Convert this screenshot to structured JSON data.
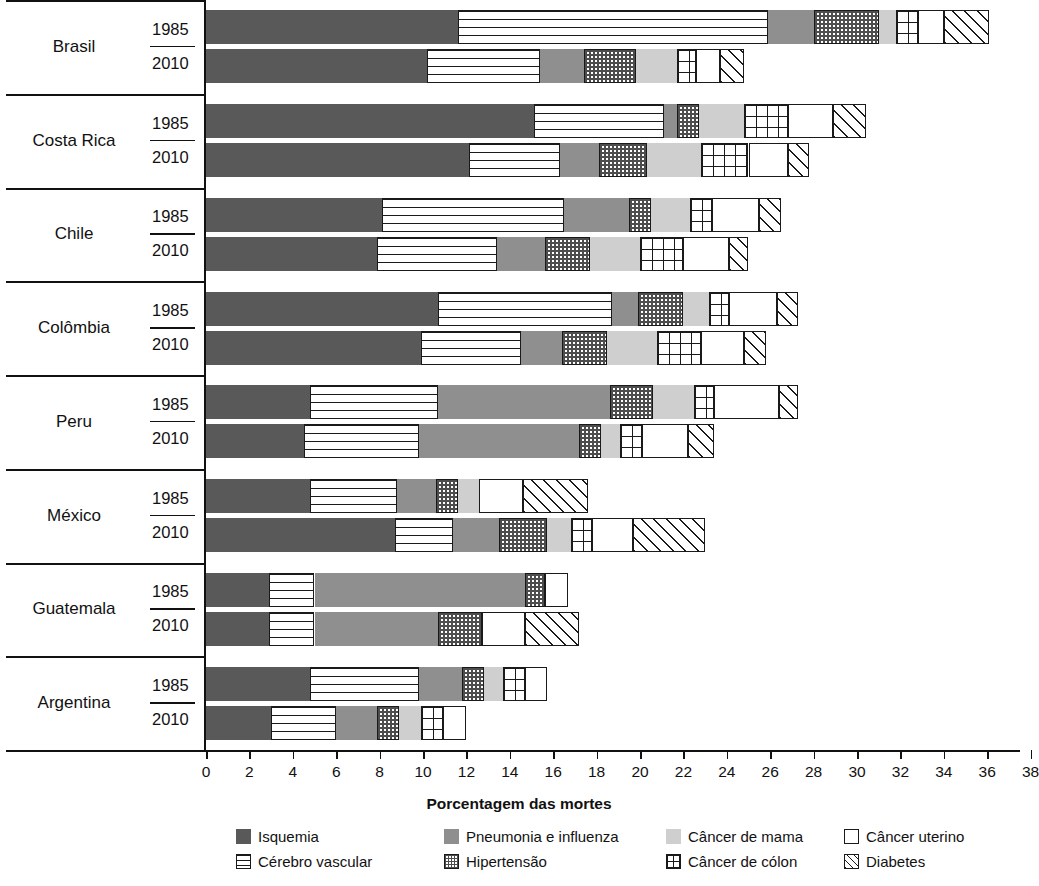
{
  "chart_data": {
    "type": "bar",
    "orientation": "horizontal",
    "stacked": true,
    "title": "",
    "xlabel": "Porcentagem das mortes",
    "ylabel": "",
    "xlim": [
      0,
      38
    ],
    "xticks": [
      0,
      2,
      4,
      6,
      8,
      10,
      12,
      14,
      16,
      18,
      20,
      22,
      24,
      26,
      28,
      30,
      32,
      34,
      36,
      38
    ],
    "grid": false,
    "legend_position": "bottom",
    "series": [
      {
        "name": "Isquemia",
        "key": "isquemia",
        "fill": "solid-dark-gray",
        "color": "#595959"
      },
      {
        "name": "Cérebro vascular",
        "key": "cerebro",
        "fill": "horizontal-lines",
        "color": "#ffffff"
      },
      {
        "name": "Pneumonia e influenza",
        "key": "pneumonia",
        "fill": "solid-mid-gray",
        "color": "#8f8f8f"
      },
      {
        "name": "Hipertensão",
        "key": "hipertensao",
        "fill": "checkerboard",
        "color": "#ffffff"
      },
      {
        "name": "Câncer de mama",
        "key": "mama",
        "fill": "solid-light-gray",
        "color": "#cfcfcf"
      },
      {
        "name": "Câncer de cólon",
        "key": "colon",
        "fill": "grid",
        "color": "#ffffff"
      },
      {
        "name": "Câncer uterino",
        "key": "uterino",
        "fill": "white",
        "color": "#ffffff"
      },
      {
        "name": "Diabetes",
        "key": "diabetes",
        "fill": "diagonal-hatch",
        "color": "#ffffff"
      }
    ],
    "groups": [
      {
        "country": "Brasil",
        "rows": [
          {
            "year": "1985",
            "values": {
              "isquemia": 11.6,
              "cerebro": 14.3,
              "pneumonia": 2.1,
              "hipertensao": 3.0,
              "mama": 0.8,
              "colon": 1.0,
              "uterino": 1.2,
              "diabetes": 2.1
            }
          },
          {
            "year": "2010",
            "values": {
              "isquemia": 10.2,
              "cerebro": 5.2,
              "pneumonia": 2.0,
              "hipertensao": 2.4,
              "mama": 1.9,
              "colon": 0.9,
              "uterino": 1.1,
              "diabetes": 1.1
            }
          }
        ]
      },
      {
        "country": "Costa Rica",
        "rows": [
          {
            "year": "1985",
            "values": {
              "isquemia": 15.1,
              "cerebro": 6.0,
              "pneumonia": 0.6,
              "hipertensao": 1.0,
              "mama": 2.1,
              "colon": 2.0,
              "uterino": 2.1,
              "diabetes": 1.5
            }
          },
          {
            "year": "2010",
            "values": {
              "isquemia": 12.1,
              "cerebro": 4.2,
              "pneumonia": 1.8,
              "hipertensao": 2.2,
              "mama": 2.5,
              "colon": 2.2,
              "uterino": 1.8,
              "diabetes": 1.0
            }
          }
        ]
      },
      {
        "country": "Chile",
        "rows": [
          {
            "year": "1985",
            "values": {
              "isquemia": 8.1,
              "cerebro": 8.4,
              "pneumonia": 3.0,
              "hipertensao": 1.0,
              "mama": 1.8,
              "colon": 1.0,
              "uterino": 2.2,
              "diabetes": 1.0
            }
          },
          {
            "year": "2010",
            "values": {
              "isquemia": 7.9,
              "cerebro": 5.5,
              "pneumonia": 2.2,
              "hipertensao": 2.1,
              "mama": 2.3,
              "colon": 2.0,
              "uterino": 2.1,
              "diabetes": 0.9
            }
          }
        ]
      },
      {
        "country": "Colômbia",
        "rows": [
          {
            "year": "1985",
            "values": {
              "isquemia": 10.7,
              "cerebro": 8.0,
              "pneumonia": 1.2,
              "hipertensao": 2.1,
              "mama": 1.2,
              "colon": 0.9,
              "uterino": 2.2,
              "diabetes": 1.0
            }
          },
          {
            "year": "2010",
            "values": {
              "isquemia": 9.9,
              "cerebro": 4.6,
              "pneumonia": 1.9,
              "hipertensao": 2.1,
              "mama": 2.3,
              "colon": 2.0,
              "uterino": 2.0,
              "diabetes": 1.0
            }
          }
        ]
      },
      {
        "country": "Peru",
        "rows": [
          {
            "year": "1985",
            "values": {
              "isquemia": 4.8,
              "cerebro": 5.9,
              "pneumonia": 7.9,
              "hipertensao": 2.0,
              "mama": 1.9,
              "colon": 0.9,
              "uterino": 3.0,
              "diabetes": 0.9
            }
          },
          {
            "year": "2010",
            "values": {
              "isquemia": 4.5,
              "cerebro": 5.3,
              "pneumonia": 7.4,
              "hipertensao": 1.0,
              "mama": 0.9,
              "colon": 1.0,
              "uterino": 2.1,
              "diabetes": 1.2
            }
          }
        ]
      },
      {
        "country": "México",
        "rows": [
          {
            "year": "1985",
            "values": {
              "isquemia": 4.8,
              "cerebro": 4.0,
              "pneumonia": 1.8,
              "hipertensao": 1.0,
              "mama": 1.0,
              "colon": 0.0,
              "uterino": 2.0,
              "diabetes": 3.0
            }
          },
          {
            "year": "2010",
            "values": {
              "isquemia": 8.7,
              "cerebro": 2.7,
              "pneumonia": 2.1,
              "hipertensao": 2.2,
              "mama": 1.1,
              "colon": 1.0,
              "uterino": 1.9,
              "diabetes": 3.3
            }
          }
        ]
      },
      {
        "country": "Guatemala",
        "rows": [
          {
            "year": "1985",
            "values": {
              "isquemia": 2.9,
              "cerebro": 2.1,
              "pneumonia": 9.7,
              "hipertensao": 0.9,
              "mama": 0.0,
              "colon": 0.0,
              "uterino": 1.1,
              "diabetes": 0.0
            }
          },
          {
            "year": "2010",
            "values": {
              "isquemia": 2.9,
              "cerebro": 2.1,
              "pneumonia": 5.7,
              "hipertensao": 2.0,
              "mama": 0.0,
              "colon": 0.0,
              "uterino": 2.0,
              "diabetes": 2.5
            }
          }
        ]
      },
      {
        "country": "Argentina",
        "rows": [
          {
            "year": "1985",
            "values": {
              "isquemia": 4.8,
              "cerebro": 5.0,
              "pneumonia": 2.0,
              "hipertensao": 1.0,
              "mama": 0.9,
              "colon": 1.0,
              "uterino": 1.0,
              "diabetes": 0.0
            }
          },
          {
            "year": "2010",
            "values": {
              "isquemia": 3.0,
              "cerebro": 3.0,
              "pneumonia": 1.9,
              "hipertensao": 1.0,
              "mama": 1.0,
              "colon": 1.0,
              "uterino": 1.1,
              "diabetes": 0.0
            }
          }
        ]
      }
    ]
  }
}
